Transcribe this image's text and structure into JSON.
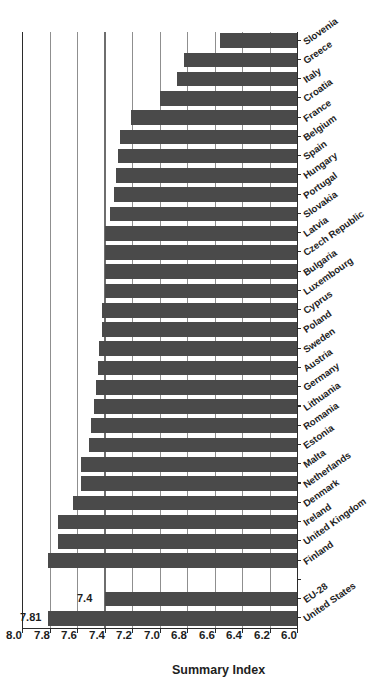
{
  "figure": {
    "axis_title": "Summary Index",
    "orientation": "page-rotated-90",
    "bar_color": "#4a4a4a",
    "grid_color": "#8f8f8f",
    "axis_color": "#2b2b2b",
    "refline_color": "#6e6e6e"
  },
  "callouts": [
    {
      "text": "7.81",
      "for": "United States"
    },
    {
      "text": "7.4",
      "for": "EU-28"
    }
  ],
  "chart_data": {
    "type": "bar",
    "title": "",
    "subtitle": "",
    "xlabel": "",
    "ylabel": "Summary Index",
    "ylim": [
      6.0,
      8.0
    ],
    "grid": true,
    "legend": "none",
    "orientation": "vertical-bars-on-rotated-page",
    "yticks": [
      "8.0",
      "7.8",
      "7.6",
      "7.4",
      "7.2",
      "7.0",
      "6.8",
      "6.6",
      "6.4",
      "6.2",
      "6.0"
    ],
    "ytick_values": [
      8.0,
      7.8,
      7.6,
      7.4,
      7.2,
      7.0,
      6.8,
      6.6,
      6.4,
      6.2,
      6.0
    ],
    "reference_line": {
      "value": 7.4,
      "label": "7.4"
    },
    "annotations": [
      {
        "value": 7.81,
        "label": "7.81",
        "category": "United States"
      },
      {
        "value": 7.4,
        "label": "7.4",
        "category": "EU-28"
      }
    ],
    "categories": [
      "United States",
      "EU-28",
      "",
      "Finland",
      "United Kingdom",
      "Ireland",
      "Denmark",
      "Netherlands",
      "Malta",
      "Estonia",
      "Romania",
      "Lithuania",
      "Germany",
      "Austria",
      "Sweden",
      "Poland",
      "Cyprus",
      "Luxembourg",
      "Bulgaria",
      "Czech Republic",
      "Latvia",
      "Slovakia",
      "Portugal",
      "Hungary",
      "Spain",
      "Belgium",
      "France",
      "Croatia",
      "Italy",
      "Greece",
      "Slovenia"
    ],
    "values": [
      7.81,
      7.4,
      null,
      7.81,
      7.74,
      7.74,
      7.63,
      7.57,
      7.57,
      7.51,
      7.5,
      7.48,
      7.46,
      7.45,
      7.44,
      7.42,
      7.42,
      7.4,
      7.4,
      7.4,
      7.4,
      7.36,
      7.33,
      7.32,
      7.3,
      7.29,
      7.21,
      7.0,
      6.87,
      6.82,
      6.56
    ]
  }
}
